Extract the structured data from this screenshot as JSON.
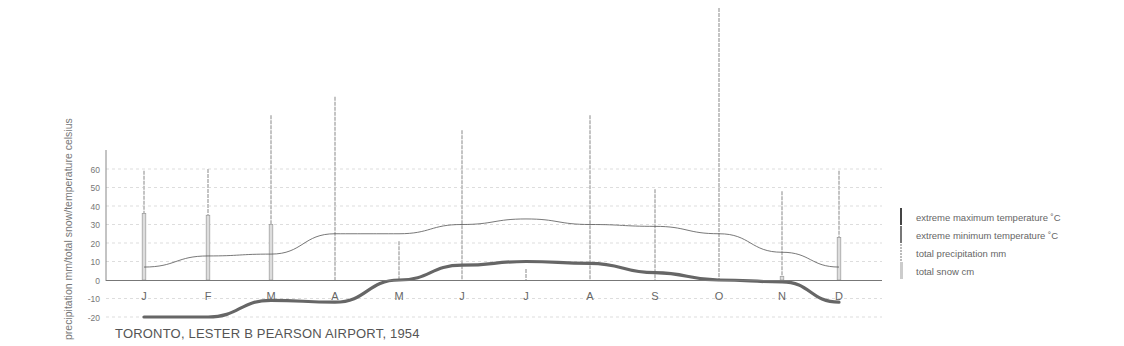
{
  "title": "TORONTO, LESTER B PEARSON AIRPORT, 1954",
  "ylabel": "precipitation mm/total snow/temperature celsius",
  "legend": [
    {
      "label": "extreme maximum temperature ˚C",
      "color": "#444444"
    },
    {
      "label": "extreme minimum temperature ˚C",
      "color": "#666666"
    },
    {
      "label": "total precipitation mm",
      "color": "#bbbbbb"
    },
    {
      "label": "total snow cm",
      "color": "#cccccc"
    }
  ],
  "chart_data": {
    "type": "line",
    "title": "TORONTO, LESTER B PEARSON AIRPORT, 1954",
    "xlabel": "",
    "ylabel": "precipitation mm/total snow/temperature celsius",
    "categories": [
      "J",
      "F",
      "M",
      "A",
      "M",
      "J",
      "J",
      "A",
      "S",
      "O",
      "N",
      "D"
    ],
    "yticks": [
      60,
      50,
      40,
      30,
      20,
      10,
      0,
      -10,
      -20
    ],
    "ylim": [
      -25,
      150
    ],
    "grid": true,
    "legend_position": "right",
    "series": [
      {
        "name": "extreme maximum temperature ˚C",
        "type": "line",
        "values": [
          7,
          13,
          14,
          25,
          25,
          30,
          33,
          30,
          29,
          25,
          15,
          7
        ]
      },
      {
        "name": "extreme minimum temperature ˚C",
        "type": "line",
        "values": [
          -20,
          -20,
          -11,
          -12,
          0,
          8,
          10,
          9,
          4,
          0,
          -1,
          -12
        ]
      },
      {
        "name": "total precipitation mm",
        "type": "bar",
        "values": [
          59,
          60,
          89,
          99,
          21,
          81,
          6,
          89,
          49,
          147,
          48,
          59
        ]
      },
      {
        "name": "total snow cm",
        "type": "bar",
        "values": [
          36,
          35,
          30,
          0,
          0,
          0,
          0,
          0,
          0,
          0,
          2,
          23
        ]
      }
    ]
  }
}
